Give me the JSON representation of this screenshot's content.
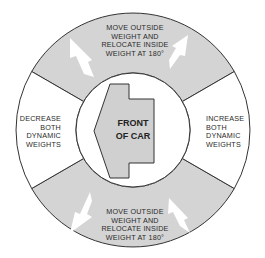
{
  "diagram": {
    "center_arrow": {
      "lines": [
        "FRONT",
        "OF CAR"
      ],
      "icon": "left-arrow-icon"
    },
    "segments": {
      "top": {
        "lines": [
          "MOVE OUTSIDE",
          "WEIGHT AND",
          "RELOCATE INSIDE",
          "WEIGHT AT 180°"
        ],
        "fill": "#d4d4d4"
      },
      "bottom": {
        "lines": [
          "MOVE OUTSIDE",
          "WEIGHT AND",
          "RELOCATE INSIDE",
          "WEIGHT AT 180°"
        ],
        "fill": "#d4d4d4"
      },
      "left": {
        "lines": [
          "DECREASE",
          "BOTH",
          "DYNAMIC",
          "WEIGHTS"
        ],
        "fill": "#ffffff"
      },
      "right": {
        "lines": [
          "INCREASE",
          "BOTH",
          "DYNAMIC",
          "WEIGHTS"
        ],
        "fill": "#ffffff"
      }
    },
    "colors": {
      "shaded": "#d4d4d4",
      "stroke": "#333333",
      "arrow_fill": "#d0d0d0",
      "white_arrow": "#ffffff"
    }
  }
}
